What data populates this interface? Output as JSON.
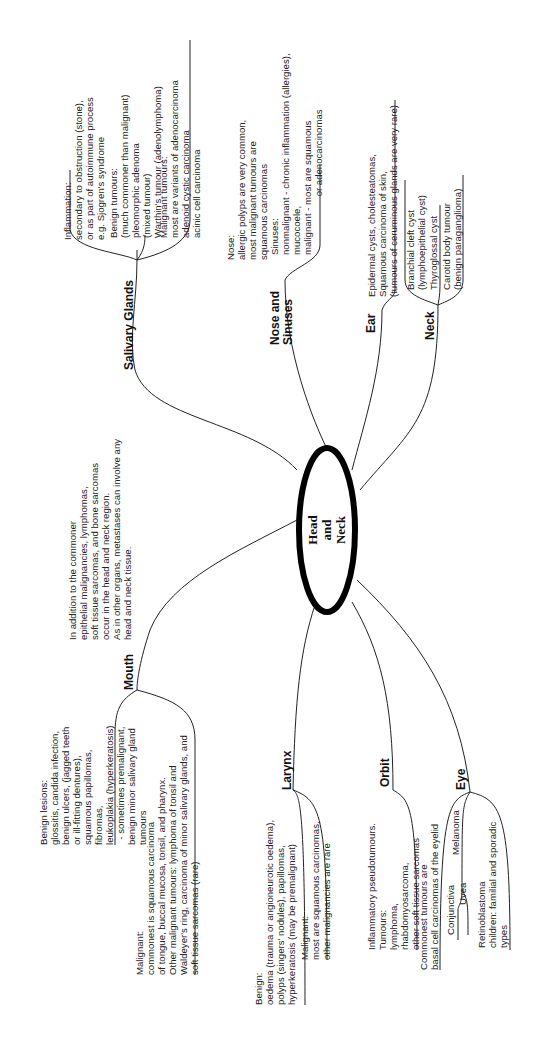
{
  "center": {
    "line1": "Head",
    "line2": "and",
    "line3": "Neck"
  },
  "intro": {
    "lines": [
      "In addition to the commoner",
      "epithelial malignancies, lymphomas,",
      "soft tissue sarcomas, and bone sarcomas",
      "occur in the head and neck region.",
      "As in other organs, metastases can involve any",
      "head and neck tissue."
    ]
  },
  "salivary": {
    "title": "Salivary Glands",
    "inflammation": [
      "Inflammation:",
      "secondary to obstruction (stone),",
      "or as part of autoimmune process",
      "e.g. Sjogren's syndrome"
    ],
    "benign": [
      "Benign tumours:",
      "(much commoner than malignant)",
      "pleomorphic adenoma",
      "(mixed tumour)",
      "Warthin's tumour (adenolymphoma)"
    ],
    "malignant": [
      "Malignant tumours:",
      "most are variants of adenocarcinoma",
      "adenoid cystic carcinoma",
      "acinic cell carcinoma"
    ]
  },
  "nose": {
    "title1": "Nose and",
    "title2": "Sinuses",
    "nose": [
      "Nose:",
      "allergic polyps are very common,",
      "most malignant tumours are",
      "squamous carcinomas"
    ],
    "sinuses": [
      "Sinuses:",
      "nonmalignant - chronic inflammation (allergies),",
      "mucocoele,",
      "malignant - most are squamous",
      "                      or adenocarcinomas"
    ]
  },
  "ear": {
    "title": "Ear",
    "lines": [
      "Epidermal cysts, cholesteatomas,",
      "Squamous carcinoma of skin,",
      "(tumours of ceruminous glands are very rare)"
    ]
  },
  "neck": {
    "title": "Neck",
    "branchial": [
      "Branchial cleft cyst",
      "(lymphoepithelial cyst)"
    ],
    "thyroglossal": [
      "Thyroglossal cyst"
    ],
    "carotid": [
      "Carotid body tumour",
      "(benign paraganglioma)"
    ]
  },
  "mouth": {
    "title": "Mouth",
    "benign": [
      "Benign lesions:",
      "glossitis, candida infection,",
      "benign ulcers, (jagged teeth",
      "or ill-fitting dentures),",
      "squamous papillomas,",
      "fibromas,",
      "leukoplakia (hyperkeratosis)",
      "  - sometimes premalignant,",
      "benign minor salivary gland",
      "tumours"
    ],
    "malignant": [
      "Malignant:",
      "commonest is squamous carcinoma",
      "of tongue, buccal mucosa, tonsil, and pharynx.",
      "Other malignant tumours: lymphoma of tonsil and",
      "Waldeyer's ring, carcinoma of minor salivary glands, and",
      "soft tissue sarcomas (rare)"
    ]
  },
  "larynx": {
    "title": "Larynx",
    "benign": [
      "Benign:",
      "oedema (trauma or angioneurotic oedema),",
      "polyps (singers' nodules), papillomas,",
      "hyperkeratosis (may be premalignant)"
    ],
    "malignant": [
      "Malignant:",
      "most are squamous carcinomas,",
      "other malignancies are rare"
    ]
  },
  "orbit": {
    "title": "Orbit",
    "lines": [
      "Inflammatory pseudotumours.",
      "Tumours:",
      "lymphoma,",
      "rhabdomyosarcoma,",
      "other soft tissue sarcomas"
    ]
  },
  "eye": {
    "title": "Eye",
    "eyelid": [
      "Commonest tumours are",
      "basal cell carcinomas of the eyelid"
    ],
    "melanoma": "Melanoma",
    "conjunctiva": "Conjunctiva",
    "uvea": "Uvea",
    "retino": [
      "Retinoblastoma",
      "children: familial and sporadic",
      "types"
    ]
  }
}
